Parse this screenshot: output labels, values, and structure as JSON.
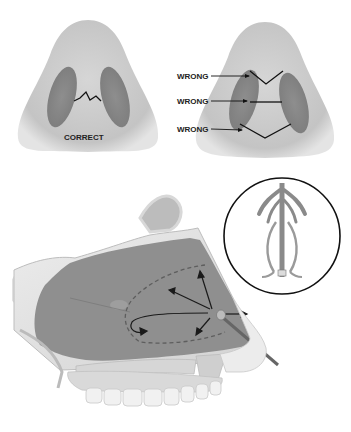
{
  "figure": {
    "panels": [
      {
        "id": "nose-correct",
        "view": "inferior view of nasal base",
        "label": "CORRECT"
      },
      {
        "id": "nose-wrong",
        "view": "inferior view of nasal base",
        "labels": [
          "WRONG",
          "WRONG",
          "WRONG"
        ]
      },
      {
        "id": "sagittal-section",
        "view": "lateral sagittal section of nasal cavity with applicator and directional arrows"
      },
      {
        "id": "inset-circle",
        "view": "inset showing packing/stent device"
      }
    ],
    "colors": {
      "skin": "#c9c9c9",
      "nostril": "#8a8a8a",
      "cavity": "#8f8f8f",
      "bone": "#e2e2e2",
      "line": "#111111"
    }
  }
}
